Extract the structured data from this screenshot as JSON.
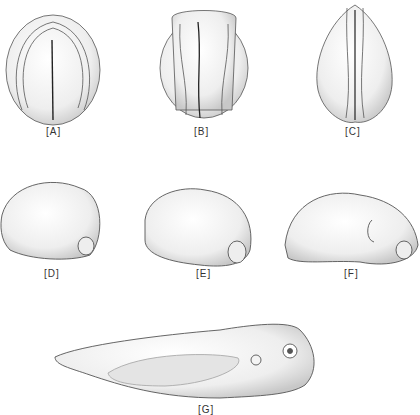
{
  "figure": {
    "panels": [
      {
        "id": "A",
        "label": "[A]",
        "view": "dorsal",
        "description": "neural plate stage embryo"
      },
      {
        "id": "B",
        "label": "[B]",
        "view": "dorsal",
        "description": "neural folds rising"
      },
      {
        "id": "C",
        "label": "[C]",
        "view": "dorsal",
        "description": "neural folds closing"
      },
      {
        "id": "D",
        "label": "[D]",
        "view": "lateral",
        "description": "tailbud embryo"
      },
      {
        "id": "E",
        "label": "[E]",
        "view": "lateral",
        "description": "tailbud embryo with somites"
      },
      {
        "id": "F",
        "label": "[F]",
        "view": "lateral",
        "description": "elongating embryo"
      },
      {
        "id": "G",
        "label": "[G]",
        "view": "lateral",
        "description": "tadpole larva"
      }
    ]
  }
}
